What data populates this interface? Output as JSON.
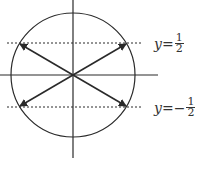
{
  "diagram": {
    "labels": {
      "top": {
        "var": "y",
        "eq": " = ",
        "sign": "",
        "num": "1",
        "den": "2"
      },
      "bottom": {
        "var": "y",
        "eq": " = ",
        "sign": "−",
        "num": "1",
        "den": "2"
      }
    },
    "colors": {
      "stroke": "#2a2a2a",
      "text": "#333333"
    }
  }
}
